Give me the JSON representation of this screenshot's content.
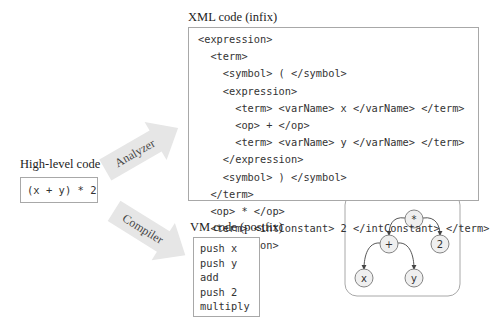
{
  "high_level": {
    "title": "High-level code",
    "code": "(x + y) * 2"
  },
  "arrows": {
    "analyzer": "Analyzer",
    "compiler": "Compiler"
  },
  "xml": {
    "title": "XML code (infix)",
    "lines": [
      "<expression>",
      "  <term>",
      "    <symbol> ( </symbol>",
      "    <expression>",
      "      <term> <varName> x </varName> </term>",
      "      <op> + </op>",
      "      <term> <varName> y </varName> </term>",
      "    </expression>",
      "    <symbol> ) </symbol>",
      "  </term>",
      "  <op> * </op>",
      "  <term> <intConstant> 2 </intConstant> </term>",
      "</expression>"
    ]
  },
  "vm": {
    "title": "VM code (postfix)",
    "lines": [
      "push x",
      "push y",
      "add",
      "push 2",
      "multiply"
    ]
  },
  "tree": {
    "nodes": [
      {
        "id": "mul",
        "label": "*"
      },
      {
        "id": "add",
        "label": "+"
      },
      {
        "id": "two",
        "label": "2"
      },
      {
        "id": "x",
        "label": "x"
      },
      {
        "id": "y",
        "label": "y"
      }
    ],
    "edges": [
      [
        "mul",
        "add"
      ],
      [
        "mul",
        "two"
      ],
      [
        "add",
        "x"
      ],
      [
        "add",
        "y"
      ]
    ]
  },
  "colors": {
    "arrow_fill": "#e6e6e6",
    "border": "#a8a8a8",
    "node_fill": "#efefef"
  }
}
